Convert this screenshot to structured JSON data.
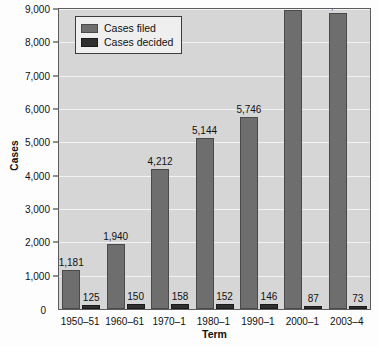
{
  "chart_data": {
    "type": "bar",
    "title": "",
    "xlabel": "Term",
    "ylabel": "Cases",
    "categories": [
      "1950–51",
      "1960–61",
      "1970–1",
      "1980–1",
      "1990–1",
      "2000–1",
      "2003–4"
    ],
    "series": [
      {
        "name": "Cases filed",
        "color": "#6e6e6e",
        "values": [
          1181,
          1940,
          4212,
          5144,
          5746,
          8965,
          8883
        ],
        "labels": [
          "1,181",
          "1,940",
          "4,212",
          "5,144",
          "5,746",
          "8,965",
          "8,883"
        ]
      },
      {
        "name": "Cases decided",
        "color": "#2f2f2f",
        "values": [
          125,
          150,
          158,
          152,
          146,
          87,
          73
        ],
        "labels": [
          "125",
          "150",
          "158",
          "152",
          "146",
          "87",
          "73"
        ]
      }
    ],
    "ylim": [
      0,
      9000
    ],
    "ytick_values": [
      0,
      1000,
      2000,
      3000,
      4000,
      5000,
      6000,
      7000,
      8000,
      9000
    ],
    "ytick_labels": [
      "0",
      "1,000",
      "2,000",
      "3,000",
      "4,000",
      "5,000",
      "6,000",
      "7,000",
      "8,000",
      "9,000"
    ],
    "grid": true,
    "legend_position": "top-left",
    "plot_background": "#d6d6d6",
    "gridline_color": "#f2f2f2"
  },
  "legend": {
    "items": [
      {
        "label": "Cases filed",
        "swatch": "filed"
      },
      {
        "label": "Cases decided",
        "swatch": "decided"
      }
    ]
  },
  "axes": {
    "y_title": "Cases",
    "x_title": "Term",
    "zero_label": "0"
  }
}
